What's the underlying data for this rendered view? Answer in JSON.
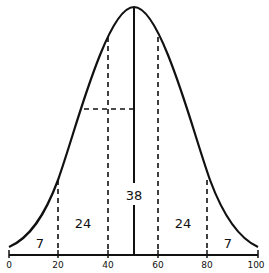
{
  "diagram": {
    "type": "normal-distribution-curve",
    "colors": {
      "stroke": "#111111",
      "background": "#ffffff"
    },
    "axis": {
      "ticks": [
        {
          "value": 0,
          "label": "0"
        },
        {
          "value": 20,
          "label": "20"
        },
        {
          "value": 40,
          "label": "40"
        },
        {
          "value": 60,
          "label": "60"
        },
        {
          "value": 80,
          "label": "80"
        },
        {
          "value": 100,
          "label": "100"
        }
      ]
    },
    "regions": [
      {
        "range": "0-20",
        "label": "7"
      },
      {
        "range": "20-40",
        "label": "24"
      },
      {
        "range": "40-60",
        "label": "38"
      },
      {
        "range": "60-80",
        "label": "24"
      },
      {
        "range": "80-100",
        "label": "7"
      }
    ]
  }
}
